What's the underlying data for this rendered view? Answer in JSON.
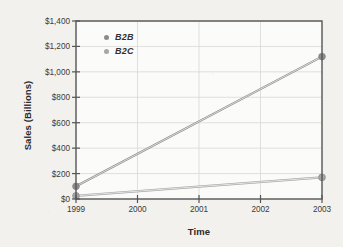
{
  "chart_data": {
    "type": "line",
    "title": "",
    "xlabel": "Time",
    "ylabel": "Sales (Billions)",
    "x": [
      1999,
      2000,
      2001,
      2002,
      2003
    ],
    "xtick_labels": [
      "1999",
      "2000",
      "2001",
      "2002",
      "2003"
    ],
    "ytick_labels": [
      "$0",
      "$200",
      "$400",
      "$600",
      "$800",
      "$1,000",
      "$1,200",
      "$1,400"
    ],
    "ytick_values": [
      0,
      200,
      400,
      600,
      800,
      1000,
      1200,
      1400
    ],
    "xlim": [
      1999,
      2003
    ],
    "ylim": [
      0,
      1400
    ],
    "grid": true,
    "legend_position": "upper-left-inside",
    "series": [
      {
        "name": "B2B",
        "color": "#8c8c8c",
        "x": [
          1999,
          2003
        ],
        "values": [
          100,
          1120
        ],
        "markers": [
          "1999",
          "2003"
        ]
      },
      {
        "name": "B2C",
        "color": "#a6a6a6",
        "x": [
          1999,
          2003
        ],
        "values": [
          25,
          170
        ],
        "markers": [
          "1999",
          "2003"
        ]
      }
    ]
  },
  "axes": {
    "y_title": "Sales (Billions)",
    "x_title": "Time"
  },
  "legend": {
    "entries": [
      {
        "label": "B2B",
        "color": "#8c8c8c"
      },
      {
        "label": "B2C",
        "color": "#a6a6a6"
      }
    ]
  },
  "colors": {
    "background": "#f2f1ee",
    "plot_background": "#fbfbfa",
    "frame": "#555555",
    "grid": "#d8d8d6",
    "text": "#333333",
    "b2b": "#8c8c8c",
    "b2c": "#a6a6a6"
  }
}
